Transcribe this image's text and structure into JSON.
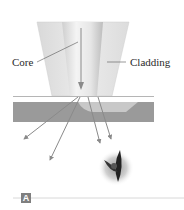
{
  "diagram": {
    "labels": {
      "core": "Core",
      "cladding": "Cladding"
    },
    "panel_badge": "A",
    "colors": {
      "cladding": "#e2e2e2",
      "core": "#f2f2f2",
      "core_shade": "#d6d6d6",
      "surface": "#9a9a9a",
      "surface_highlight": "#c8c8c8",
      "arrow": "#8a8a8a",
      "badge": "#7f7f7f",
      "rule": "#d8d8d8"
    },
    "elements": [
      "optical-fiber-tip",
      "core",
      "cladding",
      "tissue-surface",
      "scattered-light-rays",
      "eye",
      "panel-label"
    ]
  }
}
